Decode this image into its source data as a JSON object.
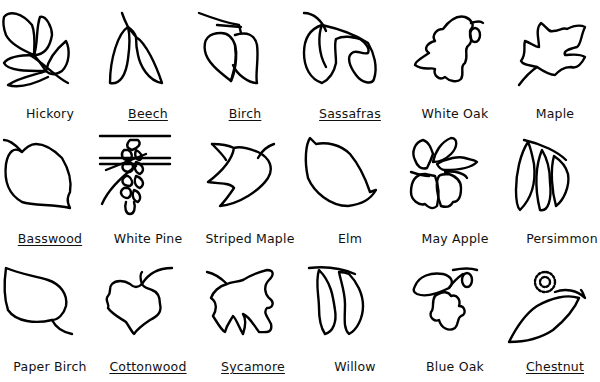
{
  "stroke_color": "#000000",
  "background_color": "#ffffff",
  "leaves": [
    {
      "name": "Hickory",
      "icon": "hickory-leaf-icon"
    },
    {
      "name": "Beech",
      "icon": "beech-leaf-icon"
    },
    {
      "name": "Birch",
      "icon": "birch-leaf-icon"
    },
    {
      "name": "Sassafras",
      "icon": "sassafras-leaf-icon"
    },
    {
      "name": "White Oak",
      "icon": "white-oak-leaf-icon"
    },
    {
      "name": "Maple",
      "icon": "maple-leaf-icon"
    },
    {
      "name": "Basswood",
      "icon": "basswood-leaf-icon"
    },
    {
      "name": "White Pine",
      "icon": "white-pine-cone-icon"
    },
    {
      "name": "Striped Maple",
      "icon": "striped-maple-leaf-icon"
    },
    {
      "name": "Elm",
      "icon": "elm-leaf-icon"
    },
    {
      "name": "May Apple",
      "icon": "may-apple-leaf-icon"
    },
    {
      "name": "Persimmon",
      "icon": "persimmon-leaf-icon"
    },
    {
      "name": "Paper Birch",
      "icon": "paper-birch-leaf-icon"
    },
    {
      "name": "Cottonwood",
      "icon": "cottonwood-leaf-icon"
    },
    {
      "name": "Sycamore",
      "icon": "sycamore-leaf-icon"
    },
    {
      "name": "Willow",
      "icon": "willow-leaf-icon"
    },
    {
      "name": "Blue Oak",
      "icon": "blue-oak-leaf-icon"
    },
    {
      "name": "Chestnut",
      "icon": "chestnut-leaf-icon"
    }
  ]
}
